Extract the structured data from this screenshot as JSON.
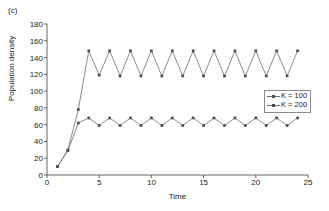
{
  "panel": {
    "label": "(c)"
  },
  "axes": {
    "xlabel": "Time",
    "ylabel": "Population density",
    "xticks": [
      "0",
      "5",
      "10",
      "15",
      "20",
      "25"
    ],
    "yticks": [
      "0",
      "20",
      "40",
      "60",
      "80",
      "100",
      "120",
      "140",
      "160",
      "180"
    ]
  },
  "legend": {
    "items": [
      {
        "label": "K = 100",
        "key": "K",
        "value": "= 100",
        "color": "#6e6e6e"
      },
      {
        "label": "K = 200",
        "key": "K",
        "value": "= 200",
        "color": "#6e6e6e"
      }
    ]
  },
  "colors": {
    "line": "#6e6e6e",
    "marker": "#4d4d4d",
    "axis": "#555555",
    "text": "#1a1a1a"
  },
  "chart_data": {
    "type": "line",
    "title": "",
    "subtitle": "",
    "xlabel": "Time",
    "ylabel": "Population density",
    "xlim": [
      0,
      25
    ],
    "ylim": [
      0,
      180
    ],
    "xticks": [
      0,
      5,
      10,
      15,
      20,
      25
    ],
    "yticks": [
      0,
      20,
      40,
      60,
      80,
      100,
      120,
      140,
      160,
      180
    ],
    "grid": false,
    "legend_position": "right-middle",
    "markers": "square",
    "annotations": [
      "(c)"
    ],
    "x": [
      1,
      2,
      3,
      4,
      5,
      6,
      7,
      8,
      9,
      10,
      11,
      12,
      13,
      14,
      15,
      16,
      17,
      18,
      19,
      20,
      21,
      22,
      23,
      24
    ],
    "series": [
      {
        "name": "K = 100",
        "values": [
          10,
          29,
          62,
          68,
          59,
          68,
          59,
          68,
          59,
          68,
          59,
          68,
          59,
          68,
          59,
          68,
          59,
          68,
          59,
          68,
          59,
          68,
          59,
          68
        ]
      },
      {
        "name": "K = 200",
        "values": [
          10,
          30,
          78,
          148,
          119,
          148,
          118,
          148,
          118,
          148,
          118,
          148,
          118,
          148,
          118,
          148,
          118,
          148,
          118,
          148,
          118,
          148,
          118,
          148
        ]
      }
    ]
  }
}
